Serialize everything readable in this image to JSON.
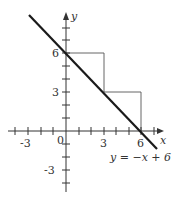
{
  "diagram": {
    "axes": {
      "x_label": "x",
      "y_label": "y",
      "origin_label": "0",
      "x_ticks": [
        "-3",
        "3",
        "6"
      ],
      "y_ticks": [
        "6",
        "3",
        "-3"
      ]
    },
    "line": {
      "equation": "y = −x + 6",
      "slope": -1,
      "intercept": 6
    },
    "rectangles": [
      {
        "x0": 0,
        "y0": 3,
        "x1": 3,
        "y1": 6
      },
      {
        "x0": 3,
        "y0": 0,
        "x1": 6,
        "y1": 3
      }
    ],
    "colors": {
      "ink": "#222222",
      "thin": "#555555"
    }
  }
}
